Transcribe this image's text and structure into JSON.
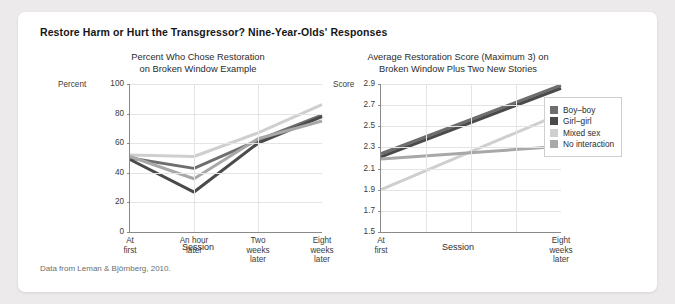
{
  "figure": {
    "title": "Restore Harm or Hurt the Transgressor? Nine-Year-Olds' Responses",
    "source": "Data from Leman & Björnberg, 2010."
  },
  "legend": {
    "items": [
      {
        "label": "Boy–boy",
        "color": "#6e6e6e"
      },
      {
        "label": "Girl–girl",
        "color": "#4a4a4a"
      },
      {
        "label": "Mixed sex",
        "color": "#cfcfcf"
      },
      {
        "label": "No interaction",
        "color": "#a8a8a8"
      }
    ]
  },
  "chart_data": [
    {
      "type": "line",
      "id": "left",
      "title": "Percent Who Chose Restoration\non Broken Window Example",
      "title_line1": "Percent Who Chose Restoration",
      "title_line2": "on Broken Window Example",
      "ylabel": "Percent",
      "xlabel": "Session",
      "ylim": [
        0,
        100
      ],
      "yticks": [
        100,
        80,
        60,
        40,
        20,
        0
      ],
      "categories": [
        "At first",
        "An hour later",
        "Two weeks later",
        "Eight weeks later"
      ],
      "xtick_lines": [
        [
          "At",
          "first"
        ],
        [
          "An hour",
          "later"
        ],
        [
          "Two",
          "weeks",
          "later"
        ],
        [
          "Eight",
          "weeks",
          "later"
        ]
      ],
      "grid": true,
      "series": [
        {
          "name": "Boy–boy",
          "color": "#6e6e6e",
          "values": [
            50,
            43,
            62,
            79
          ]
        },
        {
          "name": "Girl–girl",
          "color": "#4a4a4a",
          "values": [
            49,
            27,
            60,
            78
          ]
        },
        {
          "name": "Mixed sex",
          "color": "#cfcfcf",
          "values": [
            52,
            51,
            67,
            86
          ]
        },
        {
          "name": "No interaction",
          "color": "#a8a8a8",
          "values": [
            51,
            36,
            63,
            75
          ]
        }
      ]
    },
    {
      "type": "line",
      "id": "right",
      "title": "Average Restoration Score (Maximum 3) on\nBroken Window Plus Two New Stories",
      "title_line1": "Average Restoration Score (Maximum 3) on",
      "title_line2": "Broken Window Plus Two New Stories",
      "ylabel": "Score",
      "xlabel": "Session",
      "ylim": [
        1.5,
        2.9
      ],
      "yticks": [
        "2.9",
        "2.7",
        "2.5",
        "2.3",
        "2.1",
        "1.9",
        "1.7",
        "1.5"
      ],
      "categories": [
        "At first",
        "Eight weeks later"
      ],
      "xtick_lines": [
        [
          "At",
          "first"
        ],
        [
          "Eight",
          "weeks",
          "later"
        ]
      ],
      "grid": true,
      "series": [
        {
          "name": "Boy–boy",
          "color": "#6e6e6e",
          "values": [
            2.24,
            2.89
          ]
        },
        {
          "name": "Girl–girl",
          "color": "#4a4a4a",
          "values": [
            2.21,
            2.86
          ]
        },
        {
          "name": "Mixed sex",
          "color": "#cfcfcf",
          "values": [
            1.9,
            2.62
          ]
        },
        {
          "name": "No interaction",
          "color": "#a8a8a8",
          "values": [
            2.19,
            2.31
          ]
        }
      ]
    }
  ]
}
